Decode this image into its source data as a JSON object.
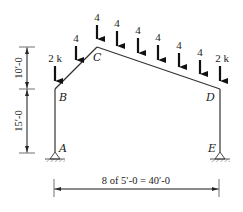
{
  "diagram": {
    "type": "gable-frame-loading",
    "nodes": [
      {
        "id": "A",
        "label": "A",
        "x": 55,
        "y": 152
      },
      {
        "id": "B",
        "label": "B",
        "x": 55,
        "y": 89
      },
      {
        "id": "C",
        "label": "C",
        "x": 97,
        "y": 47
      },
      {
        "id": "D",
        "label": "D",
        "x": 220,
        "y": 89
      },
      {
        "id": "E",
        "label": "E",
        "x": 220,
        "y": 152
      }
    ],
    "loads": [
      {
        "x": 55,
        "label": "2 k"
      },
      {
        "x": 76,
        "label": "4"
      },
      {
        "x": 97,
        "label": "4"
      },
      {
        "x": 117,
        "label": "4"
      },
      {
        "x": 138,
        "label": "4"
      },
      {
        "x": 158,
        "label": "4"
      },
      {
        "x": 179,
        "label": "4"
      },
      {
        "x": 200,
        "label": "4"
      },
      {
        "x": 220,
        "label": "2 k"
      }
    ],
    "dimensions": {
      "vertical_upper": "10′-0",
      "vertical_lower": "15′-0",
      "horizontal": "8 of 5′-0 = 40′-0"
    },
    "supports": [
      "pin at A",
      "pin at E"
    ]
  }
}
